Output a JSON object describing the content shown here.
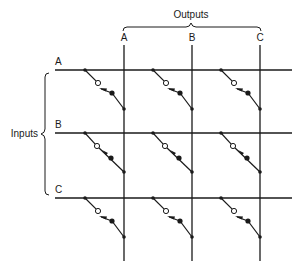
{
  "diagram": {
    "title_outputs": "Outputs",
    "title_inputs": "Inputs",
    "outputs": [
      {
        "label": "A",
        "x": 124
      },
      {
        "label": "B",
        "x": 192
      },
      {
        "label": "C",
        "x": 260
      }
    ],
    "inputs": [
      {
        "label": "A",
        "y": 70
      },
      {
        "label": "B",
        "y": 133
      },
      {
        "label": "C",
        "y": 198
      }
    ],
    "switch_states": {
      "A": [
        "open",
        "open",
        "open"
      ],
      "B": [
        "closed",
        "closed",
        "closed"
      ],
      "C": [
        "open",
        "open",
        "open"
      ]
    },
    "colors": {
      "line": "#1a1a1a",
      "background": "#ffffff"
    }
  }
}
